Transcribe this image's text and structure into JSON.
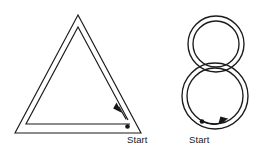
{
  "figure": {
    "background_color": "#ffffff",
    "stroke_color": "#1b1b1b",
    "shapes": [
      {
        "id": "triangle",
        "name": "double-line-triangle",
        "label": "Start",
        "direction": "counter-clockwise",
        "outer_points": "78,15 15,133 141,133",
        "inner_points": "78,27 26,124 130,124",
        "start_dot": {
          "x": 127,
          "y": 126
        },
        "arrow": {
          "from": {
            "x": 126,
            "y": 120
          },
          "to": {
            "x": 117,
            "y": 104
          },
          "head": "117,103 121,113 113,110"
        }
      },
      {
        "id": "figure-eight",
        "name": "double-line-figure-eight",
        "label": "Start",
        "direction": "clockwise",
        "top_circle": {
          "cx": 216,
          "cy": 44,
          "r_outer": 28,
          "r_inner": 23
        },
        "bottom_circle": {
          "cx": 215,
          "cy": 96,
          "r_outer": 33,
          "r_inner": 28
        },
        "start_dot": {
          "x": 202,
          "y": 122
        },
        "arrow": {
          "path": "M 202,122 Q 214,128 226,121",
          "head": "228,120 219,124 221,117"
        }
      }
    ],
    "labels": {
      "triangle_start": "Start",
      "eight_start": "Start"
    }
  }
}
